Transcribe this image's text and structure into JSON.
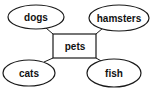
{
  "diagram": {
    "type": "mind-map",
    "center": {
      "id": "pets",
      "label": "pets"
    },
    "nodes": [
      {
        "id": "dogs",
        "label": "dogs"
      },
      {
        "id": "hamsters",
        "label": "hamsters"
      },
      {
        "id": "cats",
        "label": "cats"
      },
      {
        "id": "fish",
        "label": "fish"
      }
    ],
    "edges": [
      {
        "from": "pets",
        "to": "dogs"
      },
      {
        "from": "pets",
        "to": "hamsters"
      },
      {
        "from": "pets",
        "to": "cats"
      },
      {
        "from": "pets",
        "to": "fish"
      }
    ]
  }
}
